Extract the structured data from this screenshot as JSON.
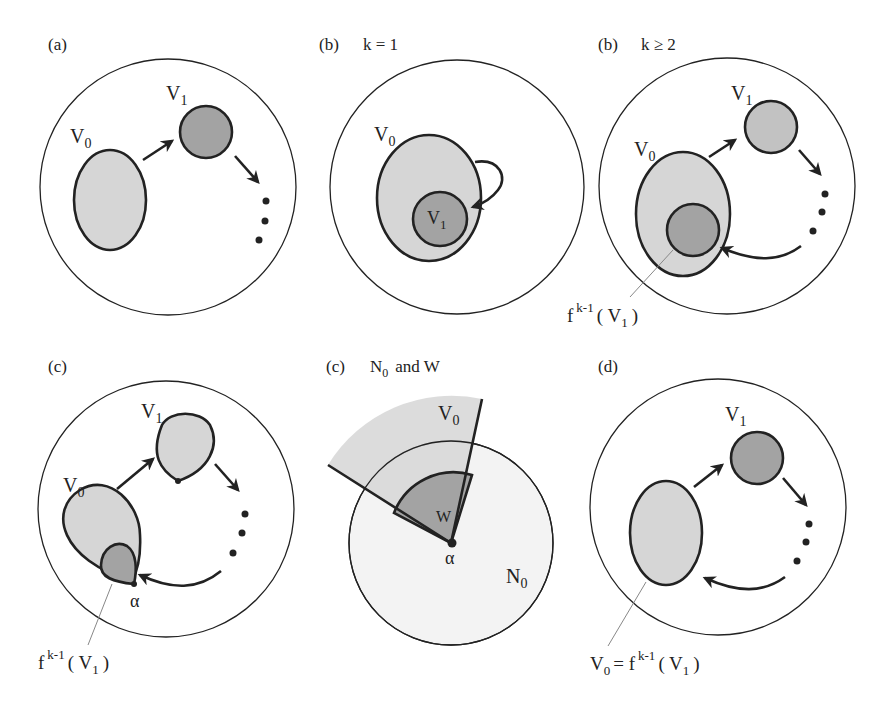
{
  "figure": {
    "panels": [
      {
        "id": "a",
        "tag": "(a)",
        "title": "",
        "labels": {
          "v0": "V",
          "v0_sub": "0",
          "v1": "V",
          "v1_sub": "1"
        }
      },
      {
        "id": "b1",
        "tag": "(b)",
        "title": "k = 1",
        "labels": {
          "v0": "V",
          "v0_sub": "0",
          "v1": "V",
          "v1_sub": "1"
        }
      },
      {
        "id": "b2",
        "tag": "(b)",
        "title": "k ≥ 2",
        "labels": {
          "v0": "V",
          "v0_sub": "0",
          "v1": "V",
          "v1_sub": "1",
          "image_f": "f",
          "image_sup": "k-1",
          "image_arg": "( V",
          "image_arg_sub": "1",
          "image_close": ")"
        }
      },
      {
        "id": "c1",
        "tag": "(c)",
        "title": "",
        "labels": {
          "v0": "V",
          "v0_sub": "0",
          "v1": "V",
          "v1_sub": "1",
          "alpha": "α",
          "image_f": "f",
          "image_sup": "k-1",
          "image_arg": "( V",
          "image_arg_sub": "1",
          "image_close": ")"
        }
      },
      {
        "id": "c2",
        "tag": "(c)",
        "title_n": "N",
        "title_n_sub": "0",
        "title_rest": "and   W",
        "labels": {
          "v0": "V",
          "v0_sub": "0",
          "w": "W",
          "alpha": "α",
          "n0": "N",
          "n0_sub": "0"
        }
      },
      {
        "id": "d",
        "tag": "(d)",
        "title": "",
        "labels": {
          "v1": "V",
          "v1_sub": "1",
          "eq_v0": "V",
          "eq_v0_sub": "0",
          "eq_mid": "= f",
          "eq_sup": "k-1",
          "eq_arg": "( V",
          "eq_arg_sub": "1",
          "eq_close": ")"
        }
      }
    ],
    "colors": {
      "light_fill": "#d6d6d6",
      "dark_fill": "#a3a3a3",
      "stroke": "#222222",
      "background": "#ffffff"
    }
  }
}
